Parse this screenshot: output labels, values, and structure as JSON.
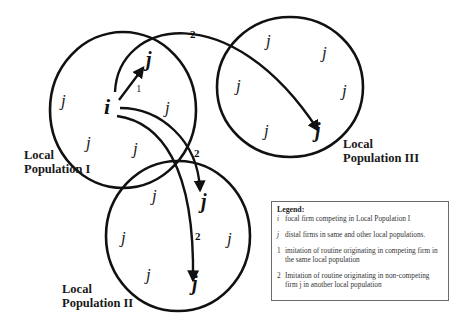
{
  "diagram": {
    "nodes": {
      "focal": "i",
      "distal": "j"
    },
    "arrow_labels": {
      "within_population": "1",
      "cross_population": "2"
    },
    "populations": [
      {
        "id": "I",
        "label_line1": "Local",
        "label_line2": "Population I"
      },
      {
        "id": "II",
        "label_line1": "Local",
        "label_line2": "Population II"
      },
      {
        "id": "III",
        "label_line1": "Local",
        "label_line2": "Population III"
      }
    ],
    "legend": {
      "title": "Legend:",
      "items": [
        {
          "key": "i",
          "text": "focal firm competing in Local Population I"
        },
        {
          "key": "j",
          "text": "distal firms in same and other local populations."
        },
        {
          "key": "1",
          "text": "imitation of routine originating in competing firm in the same local population"
        },
        {
          "key": "2",
          "text": "Imitation of routine originating in non-competing firm j in another local population"
        }
      ]
    }
  }
}
